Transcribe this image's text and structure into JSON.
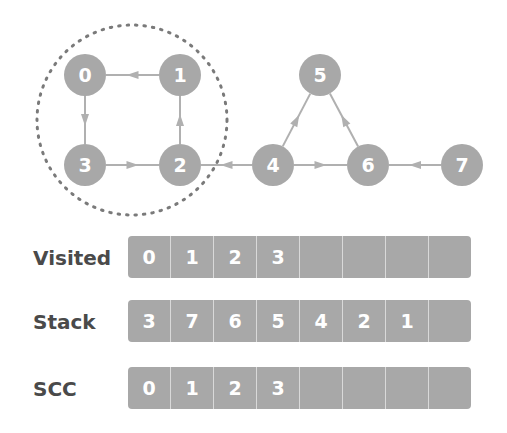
{
  "graph": {
    "nodes": [
      {
        "id": "0",
        "x": 85,
        "y": 75
      },
      {
        "id": "1",
        "x": 180,
        "y": 75
      },
      {
        "id": "2",
        "x": 180,
        "y": 165
      },
      {
        "id": "3",
        "x": 85,
        "y": 165
      },
      {
        "id": "4",
        "x": 273,
        "y": 165
      },
      {
        "id": "5",
        "x": 320,
        "y": 75
      },
      {
        "id": "6",
        "x": 368,
        "y": 165
      },
      {
        "id": "7",
        "x": 462,
        "y": 165
      }
    ],
    "edges": [
      {
        "from": "1",
        "to": "0"
      },
      {
        "from": "0",
        "to": "3"
      },
      {
        "from": "3",
        "to": "2"
      },
      {
        "from": "2",
        "to": "1"
      },
      {
        "from": "4",
        "to": "2"
      },
      {
        "from": "4",
        "to": "5"
      },
      {
        "from": "6",
        "to": "5"
      },
      {
        "from": "4",
        "to": "6"
      },
      {
        "from": "7",
        "to": "6"
      }
    ],
    "highlighted_scc": [
      "0",
      "1",
      "2",
      "3"
    ],
    "colors": {
      "node": "#a8a8a8",
      "edge": "#b0b0b0",
      "dotted_circle": "#7a7a7a"
    }
  },
  "rows": {
    "visited": {
      "label": "Visited",
      "cells": [
        "0",
        "1",
        "2",
        "3",
        "",
        "",
        "",
        ""
      ]
    },
    "stack": {
      "label": "Stack",
      "cells": [
        "3",
        "7",
        "6",
        "5",
        "4",
        "2",
        "1",
        ""
      ]
    },
    "scc": {
      "label": "SCC",
      "cells": [
        "0",
        "1",
        "2",
        "3",
        "",
        "",
        "",
        ""
      ]
    }
  }
}
